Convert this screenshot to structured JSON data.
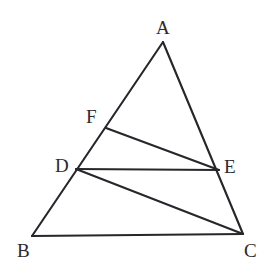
{
  "figure": {
    "kind": "triangle-with-cevians",
    "background_color": "#ffffff",
    "stroke_color": "#26262b",
    "label_color": "#2a2a30",
    "stroke_width": 2.1,
    "canvas": {
      "width": 276,
      "height": 276
    },
    "points": [
      {
        "id": "A",
        "label": "A",
        "x": 163,
        "y": 42,
        "label_x": 156,
        "label_y": 18
      },
      {
        "id": "B",
        "label": "B",
        "x": 32,
        "y": 236,
        "label_x": 17,
        "label_y": 241
      },
      {
        "id": "C",
        "label": "C",
        "x": 243,
        "y": 234,
        "label_x": 244,
        "label_y": 241
      },
      {
        "id": "D",
        "label": "D",
        "x": 76,
        "y": 169,
        "label_x": 55,
        "label_y": 156
      },
      {
        "id": "E",
        "label": "E",
        "x": 219,
        "y": 170,
        "label_x": 224,
        "label_y": 157
      },
      {
        "id": "F",
        "label": "F",
        "x": 106,
        "y": 128,
        "label_x": 86,
        "label_y": 107
      }
    ],
    "segments": [
      {
        "id": "AB",
        "from": "A",
        "to": "B",
        "name": "segment-ab"
      },
      {
        "id": "AC",
        "from": "A",
        "to": "C",
        "name": "segment-ac"
      },
      {
        "id": "BC",
        "from": "B",
        "to": "C",
        "name": "segment-bc"
      },
      {
        "id": "FE",
        "from": "F",
        "to": "E",
        "name": "segment-fe"
      },
      {
        "id": "DE",
        "from": "D",
        "to": "E",
        "name": "segment-de"
      },
      {
        "id": "DC",
        "from": "D",
        "to": "C",
        "name": "segment-dc"
      }
    ]
  }
}
